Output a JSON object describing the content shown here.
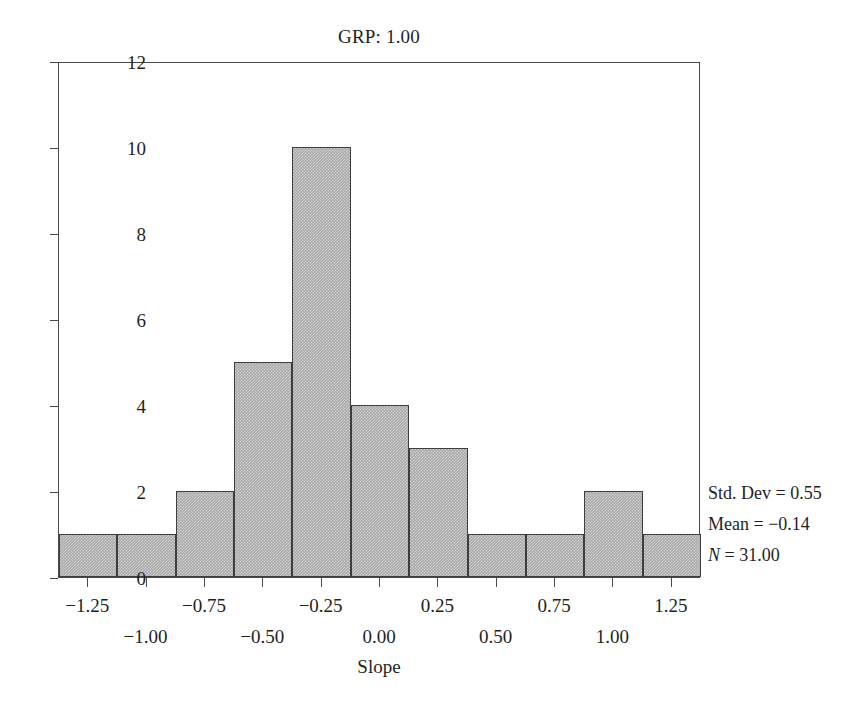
{
  "chart_data": {
    "type": "bar",
    "title": "GRP: 1.00",
    "xlabel": "Slope",
    "ylabel": "",
    "grid": false,
    "legend": "none",
    "histogram": true,
    "bin_width": 0.25,
    "bin_starts": [
      -1.375,
      -1.125,
      -0.875,
      -0.625,
      -0.375,
      -0.125,
      0.125,
      0.375,
      0.625,
      0.875,
      1.125
    ],
    "bin_centers": [
      -1.25,
      -1.0,
      -0.75,
      -0.5,
      -0.25,
      0.0,
      0.25,
      0.5,
      0.75,
      1.0,
      1.25
    ],
    "categories": [
      "-1.25",
      "-1.00",
      "-0.75",
      "-0.50",
      "-0.25",
      "0.00",
      "0.25",
      "0.50",
      "0.75",
      "1.00",
      "1.25"
    ],
    "values": [
      1,
      1,
      2,
      5,
      10,
      4,
      3,
      1,
      1,
      2,
      1
    ],
    "xlim": [
      -1.375,
      1.375
    ],
    "ylim": [
      0,
      12
    ],
    "ytick_values": [
      0,
      2,
      4,
      6,
      8,
      10,
      12
    ],
    "ytick_labels": [
      "0",
      "2",
      "4",
      "6",
      "8",
      "10",
      "12"
    ],
    "xtick_values": [
      -1.25,
      -1.0,
      -0.75,
      -0.5,
      -0.25,
      0.0,
      0.25,
      0.5,
      0.75,
      1.0,
      1.25
    ],
    "xtick_labels": [
      "−1.25",
      "−1.00",
      "−0.75",
      "−0.50",
      "−0.25",
      "0.00",
      "0.25",
      "0.50",
      "0.75",
      "1.00",
      "1.25"
    ],
    "xtick_label_rows": [
      0,
      1,
      0,
      1,
      0,
      1,
      0,
      1,
      0,
      1,
      0
    ],
    "bar_color": "#a9a9a9",
    "bar_edge_color": "#3d3d3d",
    "annotations": [
      "Std. Dev = 0.55",
      "Mean = −0.14",
      "N = 31.00"
    ]
  },
  "stats": {
    "std_dev_label": "Std. Dev = 0.55",
    "mean_label": "Mean = −0.14",
    "n_symbol": "N",
    "n_value": " = 31.00"
  }
}
